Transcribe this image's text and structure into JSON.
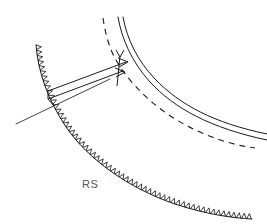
{
  "figure": {
    "background_color": "#ffffff",
    "line_color": "#1a1a1a",
    "label_color": "#555555",
    "width": 267,
    "height": 224
  },
  "labels": {
    "rs": "RS"
  },
  "elements": {
    "barbed_fault_name": "barbed-thrust-fault-curve",
    "double_line_name": "double-line-horizon",
    "dashed_curve_name": "dashed-marker-horizon",
    "dashed_upper_name": "dashed-upper-trace",
    "straight_line_name": "straight-cutoff-line",
    "arrow_upper_name": "displacement-arrow-upper",
    "arrow_lower_name": "displacement-arrow-lower",
    "connector_left_name": "arrow-connector-left",
    "connector_right_name": "arrow-connector-right"
  },
  "geometry": {
    "barbed_curve_path": "M 36 45 C 38 72, 48 100, 66 127 C 88 159, 128 188, 175 204 C 205 214, 232 218, 252 219",
    "tooth_count": 58,
    "tooth_size": 5.2,
    "double_line_outer_path": "M 118 17 C 124 46, 140 76, 166 100 C 196 127, 233 139, 267 139",
    "double_line_inner_path": "M 123 17 C 129 45, 145 74, 170 97 C 199 123, 234 134, 267 134",
    "dashed_curve_path": "M 103 18 C 107 44, 120 72, 142 96 C 172 128, 212 145, 255 148",
    "straight_line_from": [
      16,
      124
    ],
    "straight_line_to": [
      110,
      79
    ],
    "arrow_upper_from": [
      48,
      91
    ],
    "arrow_upper_to": [
      128,
      62
    ],
    "arrow_lower_from": [
      48,
      99
    ],
    "arrow_lower_to": [
      125,
      72
    ],
    "connector_left_from": [
      48,
      91
    ],
    "connector_left_to": [
      48,
      99
    ],
    "connector_right_from": [
      120,
      56
    ],
    "connector_right_to": [
      117,
      84
    ],
    "rs_label_position": [
      82,
      188
    ]
  }
}
